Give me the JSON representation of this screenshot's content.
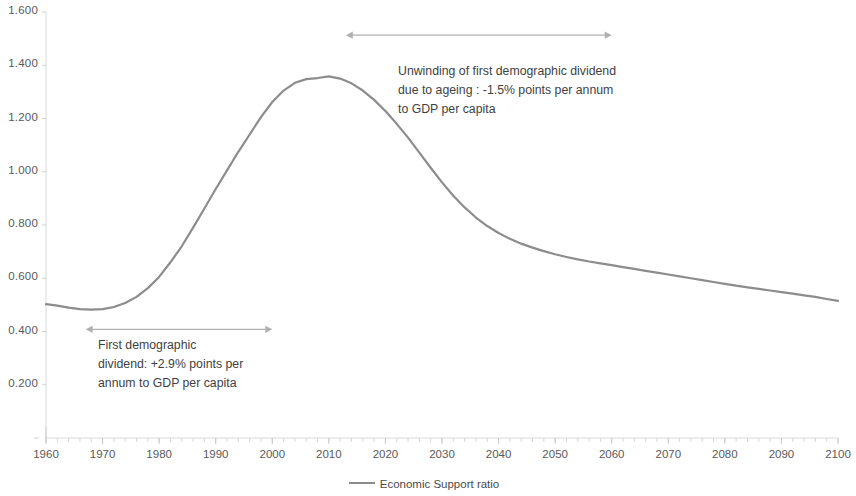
{
  "chart_data": {
    "type": "line",
    "title": "",
    "xlabel": "",
    "ylabel": "",
    "xlim": [
      1960,
      2100
    ],
    "ylim": [
      0.0,
      1.6
    ],
    "grid": false,
    "legend_position": "bottom",
    "y_ticks": [
      "0.200",
      "0.400",
      "0.600",
      "0.800",
      "1.000",
      "1.200",
      "1.400",
      "1.600"
    ],
    "y_tick_values": [
      0.2,
      0.4,
      0.6,
      0.8,
      1.0,
      1.2,
      1.4,
      1.6
    ],
    "x_ticks": [
      "1960",
      "1970",
      "1980",
      "1990",
      "2000",
      "2010",
      "2020",
      "2030",
      "2040",
      "2050",
      "2060",
      "2070",
      "2080",
      "2090",
      "2100"
    ],
    "x_tick_values": [
      1960,
      1970,
      1980,
      1990,
      2000,
      2010,
      2020,
      2030,
      2040,
      2050,
      2060,
      2070,
      2080,
      2090,
      2100
    ],
    "minor_tick_interval": 2,
    "line_color": "#8c8c8c",
    "series": [
      {
        "name": "Economic Support ratio",
        "x": [
          1960,
          1962,
          1964,
          1966,
          1968,
          1970,
          1972,
          1974,
          1976,
          1978,
          1980,
          1982,
          1984,
          1986,
          1988,
          1990,
          1992,
          1994,
          1996,
          1998,
          2000,
          2002,
          2004,
          2006,
          2008,
          2010,
          2012,
          2014,
          2016,
          2018,
          2020,
          2022,
          2024,
          2026,
          2028,
          2030,
          2032,
          2034,
          2036,
          2038,
          2040,
          2042,
          2044,
          2046,
          2048,
          2050,
          2052,
          2054,
          2056,
          2058,
          2060,
          2062,
          2064,
          2066,
          2068,
          2070,
          2072,
          2074,
          2076,
          2078,
          2080,
          2082,
          2084,
          2086,
          2088,
          2090,
          2092,
          2094,
          2096,
          2098,
          2100
        ],
        "values": [
          0.503,
          0.497,
          0.49,
          0.484,
          0.482,
          0.484,
          0.492,
          0.507,
          0.53,
          0.563,
          0.605,
          0.66,
          0.72,
          0.79,
          0.862,
          0.935,
          1.005,
          1.075,
          1.14,
          1.205,
          1.262,
          1.305,
          1.334,
          1.348,
          1.352,
          1.358,
          1.35,
          1.332,
          1.305,
          1.27,
          1.228,
          1.18,
          1.128,
          1.072,
          1.015,
          0.96,
          0.91,
          0.866,
          0.828,
          0.796,
          0.77,
          0.748,
          0.73,
          0.715,
          0.702,
          0.69,
          0.68,
          0.671,
          0.663,
          0.656,
          0.649,
          0.642,
          0.635,
          0.628,
          0.621,
          0.614,
          0.607,
          0.6,
          0.593,
          0.586,
          0.579,
          0.572,
          0.566,
          0.56,
          0.554,
          0.548,
          0.542,
          0.536,
          0.53,
          0.522,
          0.515
        ]
      }
    ],
    "annotations": [
      {
        "id": "first-dividend",
        "lines": [
          "First demographic",
          "dividend: +2.9% points per",
          "annum to GDP per capita"
        ],
        "arrow": {
          "x_start": 1967,
          "x_end": 2000,
          "y_value": 0.408,
          "style": "double-headed"
        }
      },
      {
        "id": "unwinding-dividend",
        "lines": [
          "Unwinding of first demographic dividend",
          "due to ageing : -1.5% points per annum",
          "to GDP per capita"
        ],
        "arrow": {
          "x_start": 2013,
          "x_end": 2060,
          "y_value": 1.513,
          "style": "double-headed"
        }
      }
    ],
    "legend": [
      {
        "label": "Economic Support ratio",
        "color": "#8c8c8c"
      }
    ]
  }
}
